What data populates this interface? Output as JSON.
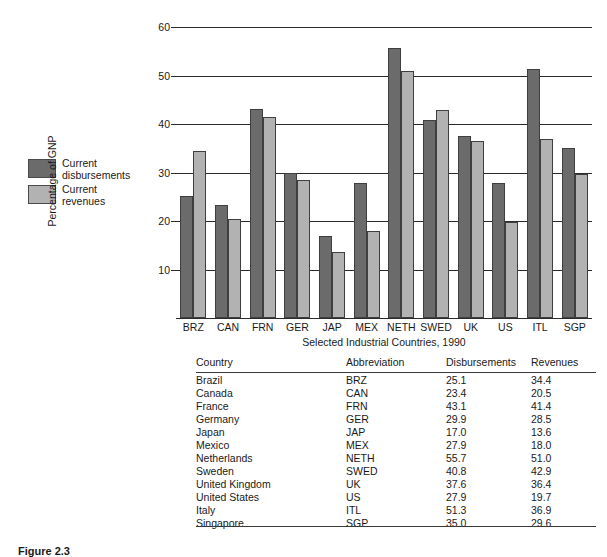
{
  "chart_data": {
    "type": "bar",
    "title": "",
    "xlabel": "Selected Industrial Countries, 1990",
    "ylabel": "Percentage of GNP",
    "ylim": [
      0,
      60
    ],
    "yticks": [
      10,
      20,
      30,
      40,
      50,
      60
    ],
    "grid": true,
    "legend_position": "left",
    "categories": [
      "BRZ",
      "CAN",
      "FRN",
      "GER",
      "JAP",
      "MEX",
      "NETH",
      "SWED",
      "UK",
      "US",
      "ITL",
      "SGP"
    ],
    "series": [
      {
        "name": "Current disbursements",
        "color": "#6b6b6b",
        "values": [
          25.1,
          23.4,
          43.1,
          29.9,
          17.0,
          27.9,
          55.7,
          40.8,
          37.6,
          27.9,
          51.3,
          35.0
        ]
      },
      {
        "name": "Current revenues",
        "color": "#b2b2b2",
        "values": [
          34.4,
          20.5,
          41.4,
          28.5,
          13.6,
          18.0,
          51.0,
          42.9,
          36.4,
          19.7,
          36.9,
          29.6
        ]
      }
    ]
  },
  "legend": {
    "items": [
      {
        "label_line1": "Current",
        "label_line2": "disbursements",
        "color": "#6b6b6b"
      },
      {
        "label_line1": "Current",
        "label_line2": "revenues",
        "color": "#b2b2b2"
      }
    ]
  },
  "table": {
    "columns": [
      "Country",
      "Abbreviation",
      "Disbursements",
      "Revenues"
    ],
    "rows": [
      {
        "country": "Brazil",
        "abbr": "BRZ",
        "disbursements": "25.1",
        "revenues": "34.4"
      },
      {
        "country": "Canada",
        "abbr": "CAN",
        "disbursements": "23.4",
        "revenues": "20.5"
      },
      {
        "country": "France",
        "abbr": "FRN",
        "disbursements": "43.1",
        "revenues": "41.4"
      },
      {
        "country": "Germany",
        "abbr": "GER",
        "disbursements": "29.9",
        "revenues": "28.5"
      },
      {
        "country": "Japan",
        "abbr": "JAP",
        "disbursements": "17.0",
        "revenues": "13.6"
      },
      {
        "country": "Mexico",
        "abbr": "MEX",
        "disbursements": "27.9",
        "revenues": "18.0"
      },
      {
        "country": "Netherlands",
        "abbr": "NETH",
        "disbursements": "55.7",
        "revenues": "51.0"
      },
      {
        "country": "Sweden",
        "abbr": "SWED",
        "disbursements": "40.8",
        "revenues": "42.9"
      },
      {
        "country": "United Kingdom",
        "abbr": "UK",
        "disbursements": "37.6",
        "revenues": "36.4"
      },
      {
        "country": "United States",
        "abbr": "US",
        "disbursements": "27.9",
        "revenues": "19.7"
      },
      {
        "country": "Italy",
        "abbr": "ITL",
        "disbursements": "51.3",
        "revenues": "36.9"
      },
      {
        "country": "Singapore",
        "abbr": "SGP",
        "disbursements": "35.0",
        "revenues": "29.6"
      }
    ]
  },
  "caption": {
    "text": "Figure 2.3"
  }
}
